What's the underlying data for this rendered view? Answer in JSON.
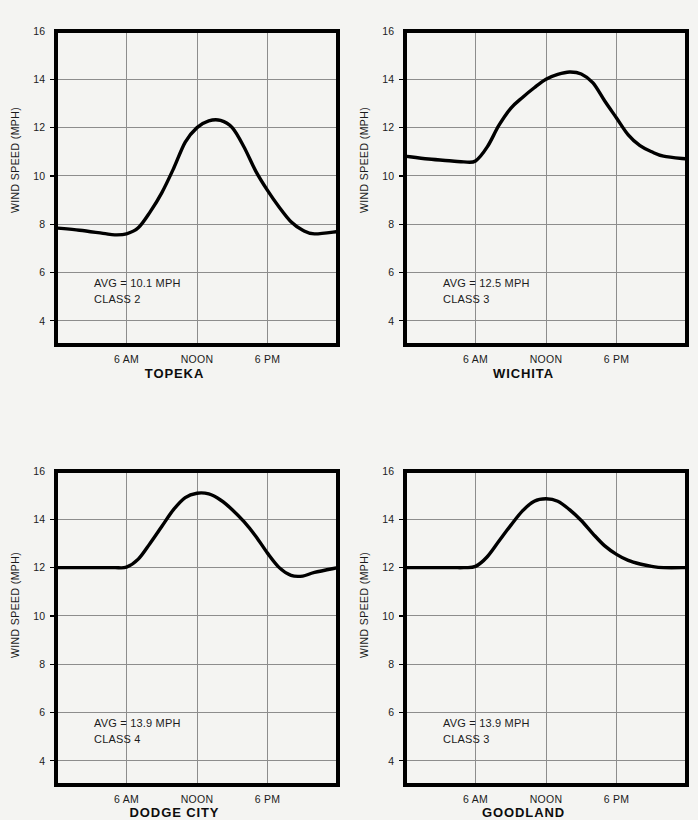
{
  "figure": {
    "background_color": "#f4f4f2",
    "line_color": "#000000",
    "grid_color": "#8d8d8d",
    "axis_label": "WIND SPEED (MPH)",
    "y_ticks": [
      "16",
      "14",
      "12",
      "10",
      "8",
      "6",
      "4"
    ],
    "x_ticks": [
      "6 AM",
      "NOON",
      "6 PM"
    ]
  },
  "chart_data": [
    {
      "type": "line",
      "title": "TOPEKA",
      "xlabel": "",
      "ylabel": "WIND SPEED (MPH)",
      "ylim": [
        3,
        16
      ],
      "xlim": [
        0,
        24
      ],
      "y_ticks": [
        16,
        14,
        12,
        10,
        8,
        6,
        4
      ],
      "x_ticks": [
        6,
        12,
        18
      ],
      "x_tick_labels": [
        "6 AM",
        "NOON",
        "6 PM"
      ],
      "grid": true,
      "legend": "none",
      "annotations": [
        "AVG = 10.1 MPH",
        "CLASS 2"
      ],
      "avg_mph": 10.1,
      "wind_class": 2,
      "x": [
        0,
        2,
        4,
        5,
        6,
        7,
        8,
        9,
        10,
        11,
        12,
        13,
        14,
        15,
        16,
        17,
        18,
        19,
        20,
        21,
        22,
        24
      ],
      "values": [
        7.85,
        7.75,
        7.62,
        7.56,
        7.6,
        7.85,
        8.5,
        9.3,
        10.3,
        11.4,
        12.0,
        12.28,
        12.3,
        12.0,
        11.2,
        10.2,
        9.4,
        8.7,
        8.1,
        7.75,
        7.6,
        7.7
      ]
    },
    {
      "type": "line",
      "title": "WICHITA",
      "xlabel": "",
      "ylabel": "WIND SPEED (MPH)",
      "ylim": [
        3,
        16
      ],
      "xlim": [
        0,
        24
      ],
      "y_ticks": [
        16,
        14,
        12,
        10,
        8,
        6,
        4
      ],
      "x_ticks": [
        6,
        12,
        18
      ],
      "x_tick_labels": [
        "6 AM",
        "NOON",
        "6 PM"
      ],
      "grid": true,
      "legend": "none",
      "annotations": [
        "AVG = 12.5 MPH",
        "CLASS 3"
      ],
      "avg_mph": 12.5,
      "wind_class": 3,
      "x": [
        0,
        2,
        4,
        5,
        6,
        7,
        8,
        9,
        10,
        11,
        12,
        13,
        14,
        15,
        16,
        17,
        18,
        19,
        20,
        21,
        22,
        24
      ],
      "values": [
        10.82,
        10.7,
        10.62,
        10.58,
        10.62,
        11.2,
        12.1,
        12.8,
        13.25,
        13.65,
        14.0,
        14.2,
        14.3,
        14.22,
        13.85,
        13.1,
        12.4,
        11.7,
        11.25,
        11.0,
        10.82,
        10.7
      ]
    },
    {
      "type": "line",
      "title": "DODGE CITY",
      "xlabel": "",
      "ylabel": "WIND SPEED (MPH)",
      "ylim": [
        3,
        16
      ],
      "xlim": [
        0,
        24
      ],
      "y_ticks": [
        16,
        14,
        12,
        10,
        8,
        6,
        4
      ],
      "x_ticks": [
        6,
        12,
        18
      ],
      "x_tick_labels": [
        "6 AM",
        "NOON",
        "6 PM"
      ],
      "grid": true,
      "legend": "none",
      "annotations": [
        "AVG = 13.9 MPH",
        "CLASS 4"
      ],
      "avg_mph": 13.9,
      "wind_class": 4,
      "x": [
        0,
        2,
        4,
        5,
        6,
        7,
        8,
        9,
        10,
        11,
        12,
        13,
        14,
        15,
        16,
        17,
        18,
        19,
        20,
        21,
        22,
        24
      ],
      "values": [
        12.0,
        12.0,
        12.0,
        12.0,
        12.02,
        12.35,
        13.0,
        13.7,
        14.4,
        14.9,
        15.08,
        15.05,
        14.8,
        14.4,
        13.9,
        13.3,
        12.6,
        12.0,
        11.68,
        11.65,
        11.8,
        12.0
      ]
    },
    {
      "type": "line",
      "title": "GOODLAND",
      "xlabel": "",
      "ylabel": "WIND SPEED (MPH)",
      "ylim": [
        3,
        16
      ],
      "xlim": [
        0,
        24
      ],
      "y_ticks": [
        16,
        14,
        12,
        10,
        8,
        6,
        4
      ],
      "x_ticks": [
        6,
        12,
        18
      ],
      "x_tick_labels": [
        "6 AM",
        "NOON",
        "6 PM"
      ],
      "grid": true,
      "legend": "none",
      "annotations": [
        "AVG = 13.9 MPH",
        "CLASS 3"
      ],
      "avg_mph": 13.9,
      "wind_class": 3,
      "x": [
        0,
        2,
        4,
        5,
        6,
        7,
        8,
        9,
        10,
        11,
        12,
        13,
        14,
        15,
        16,
        17,
        18,
        19,
        20,
        21,
        22,
        24
      ],
      "values": [
        12.0,
        12.0,
        12.0,
        12.0,
        12.05,
        12.45,
        13.1,
        13.75,
        14.35,
        14.75,
        14.85,
        14.75,
        14.4,
        13.95,
        13.4,
        12.9,
        12.55,
        12.3,
        12.15,
        12.05,
        12.0,
        12.0
      ]
    }
  ]
}
